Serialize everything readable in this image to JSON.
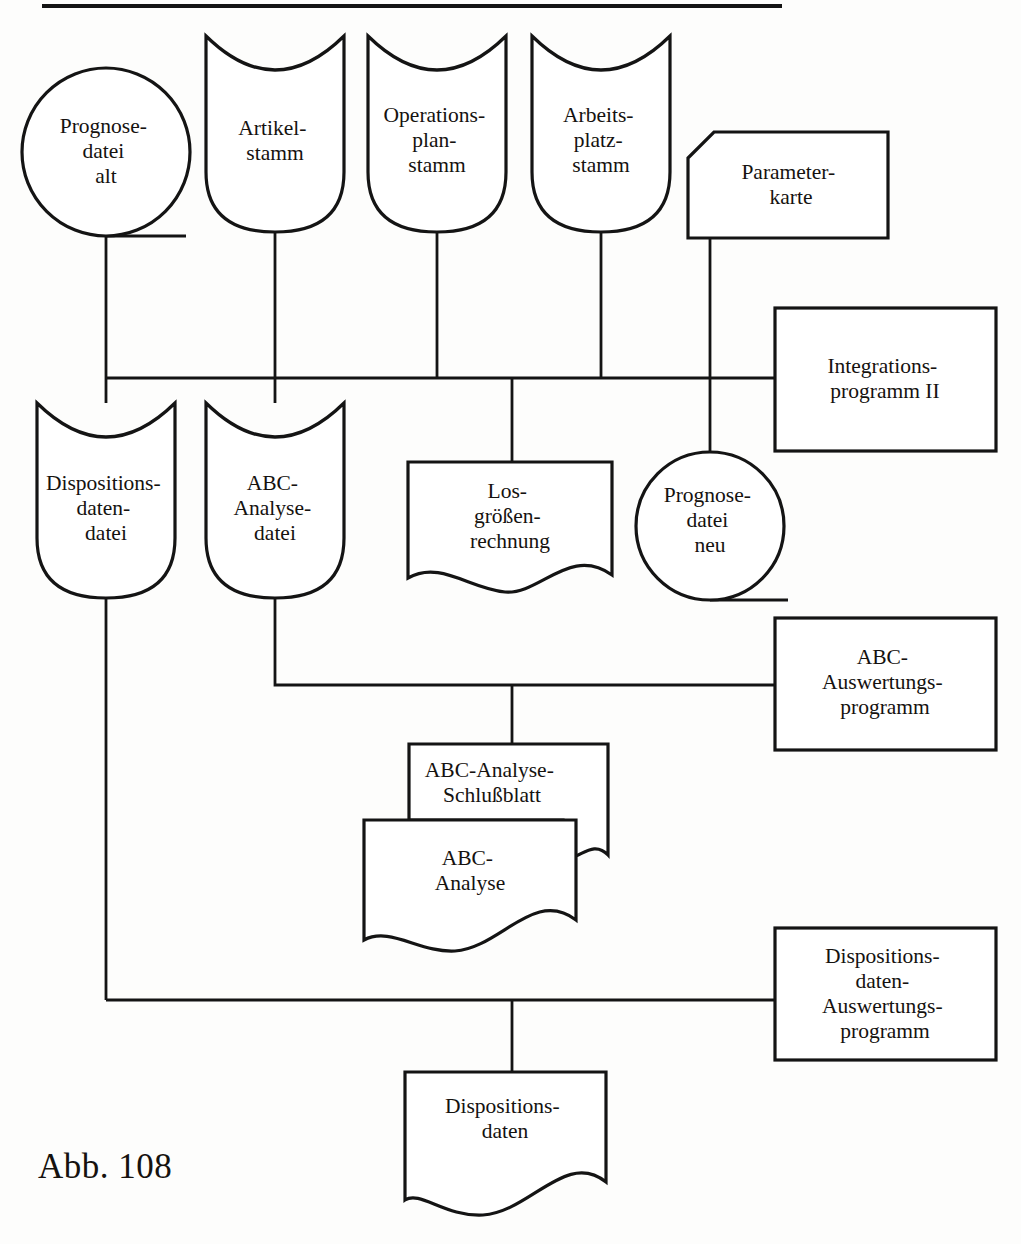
{
  "figure": {
    "caption": "Abb. 108",
    "top_rule": true
  },
  "nodes": [
    {
      "id": "prognosedatei-alt",
      "shape": "magnetic-drum",
      "lines": [
        "Prognose-",
        "datei",
        "alt"
      ]
    },
    {
      "id": "artikelstamm",
      "shape": "magnetic-tape",
      "lines": [
        "Artikel-",
        "stamm"
      ]
    },
    {
      "id": "operationsplanstamm",
      "shape": "magnetic-tape",
      "lines": [
        "Operations-",
        "plan-",
        "stamm"
      ]
    },
    {
      "id": "arbeitsplatzstamm",
      "shape": "magnetic-tape",
      "lines": [
        "Arbeits-",
        "platz-",
        "stamm"
      ]
    },
    {
      "id": "parameterkarte",
      "shape": "punched-card",
      "lines": [
        "Parameter-",
        "karte"
      ]
    },
    {
      "id": "integrationsprogramm-ii",
      "shape": "process-box",
      "lines": [
        "Integrations-",
        "programm II"
      ]
    },
    {
      "id": "dispositionsdatendatei",
      "shape": "magnetic-tape",
      "lines": [
        "Dispositions-",
        "daten-",
        "datei"
      ]
    },
    {
      "id": "abc-analysedatei",
      "shape": "magnetic-tape",
      "lines": [
        "ABC-",
        "Analyse-",
        "datei"
      ]
    },
    {
      "id": "losgroessenrechnung",
      "shape": "document",
      "lines": [
        "Los-",
        "größen-",
        "rechnung"
      ]
    },
    {
      "id": "prognosedatei-neu",
      "shape": "magnetic-drum",
      "lines": [
        "Prognose-",
        "datei",
        "neu"
      ]
    },
    {
      "id": "abc-auswertungsprogramm",
      "shape": "process-box",
      "lines": [
        "ABC-",
        "Auswertungs-",
        "programm"
      ]
    },
    {
      "id": "abc-analyse-schlussblatt",
      "shape": "document",
      "lines": [
        "ABC-Analyse-",
        "Schlußblatt"
      ]
    },
    {
      "id": "abc-analyse",
      "shape": "document",
      "lines": [
        "ABC-",
        "Analyse"
      ]
    },
    {
      "id": "dispositionsdaten-auswertungsprogramm",
      "shape": "process-box",
      "lines": [
        "Dispositions-",
        "daten-",
        "Auswertungs-",
        "programm"
      ]
    },
    {
      "id": "dispositionsdaten",
      "shape": "document",
      "lines": [
        "Dispositions-",
        "daten"
      ]
    }
  ],
  "colors": {
    "ink": "#141414",
    "paper": "#fdfdfc"
  }
}
